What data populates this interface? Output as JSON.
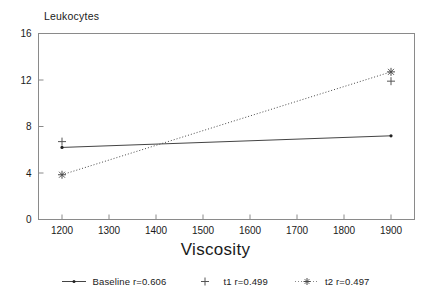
{
  "chart_data": {
    "type": "line",
    "title": "Leukocytes",
    "xlabel": "Viscosity",
    "ylabel": "",
    "xlim": [
      1150,
      1950
    ],
    "ylim": [
      0,
      16
    ],
    "grid": false,
    "legend_position": "bottom",
    "x_ticks": [
      1200,
      1300,
      1400,
      1500,
      1600,
      1700,
      1800,
      1900
    ],
    "x_tick_labels": [
      "1200",
      "1300",
      "1400",
      "1500",
      "1600",
      "1700",
      "1800",
      "1900"
    ],
    "y_ticks": [
      0,
      4,
      8,
      12,
      16
    ],
    "y_tick_labels": [
      "0",
      "4",
      "8",
      "12",
      "16"
    ],
    "x": [
      1200,
      1900
    ],
    "series": [
      {
        "name": "Baseline r=0.606",
        "short_name": "Baseline",
        "correlation": "r=0.606",
        "values": [
          6.2,
          7.2
        ],
        "line_style": "solid",
        "marker": "dot",
        "color": "#444444"
      },
      {
        "name": "t1 r=0.499",
        "short_name": "t1",
        "correlation": "r=0.499",
        "values": [
          6.7,
          11.9
        ],
        "line_style": "none",
        "marker": "plus",
        "color": "#555555"
      },
      {
        "name": "t2 r=0.497",
        "short_name": "t2",
        "correlation": "r=0.497",
        "values": [
          3.85,
          12.7
        ],
        "line_style": "dotted",
        "marker": "asterisk",
        "color": "#4a4a4a"
      }
    ]
  },
  "figure": {
    "title": "Leukocytes",
    "x_axis_title": "Viscosity",
    "y_tick_0": "0",
    "y_tick_1": "4",
    "y_tick_2": "8",
    "y_tick_3": "12",
    "y_tick_4": "16",
    "x_tick_0": "1200",
    "x_tick_1": "1300",
    "x_tick_2": "1400",
    "x_tick_3": "1500",
    "x_tick_4": "1600",
    "x_tick_5": "1700",
    "x_tick_6": "1800",
    "x_tick_7": "1900"
  },
  "legend": {
    "items": [
      {
        "label": "Baseline r=0.606"
      },
      {
        "label": "t1 r=0.499"
      },
      {
        "label": "t2 r=0.497"
      }
    ]
  }
}
